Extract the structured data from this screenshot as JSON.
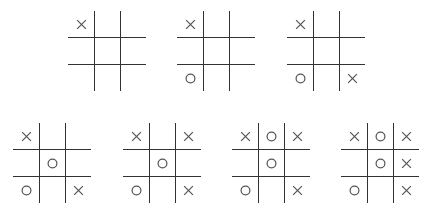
{
  "diagram": {
    "colors": {
      "line": "#333333",
      "mark": "#555555",
      "background": "#ffffff"
    },
    "boards": [
      {
        "step": 1,
        "left": 68,
        "top": 11,
        "cells": [
          "X",
          "",
          "",
          "",
          "",
          "",
          "",
          "",
          ""
        ]
      },
      {
        "step": 2,
        "left": 177,
        "top": 11,
        "cells": [
          "X",
          "",
          "",
          "",
          "",
          "",
          "O",
          "",
          ""
        ]
      },
      {
        "step": 3,
        "left": 287,
        "top": 11,
        "cells": [
          "X",
          "",
          "",
          "",
          "",
          "",
          "O",
          "",
          "X"
        ]
      },
      {
        "step": 4,
        "left": 13,
        "top": 123,
        "cells": [
          "X",
          "",
          "",
          "",
          "O",
          "",
          "O",
          "",
          "X"
        ]
      },
      {
        "step": 5,
        "left": 123,
        "top": 123,
        "cells": [
          "X",
          "",
          "X",
          "",
          "O",
          "",
          "O",
          "",
          "X"
        ]
      },
      {
        "step": 6,
        "left": 232,
        "top": 123,
        "cells": [
          "X",
          "O",
          "X",
          "",
          "O",
          "",
          "O",
          "",
          "X"
        ]
      },
      {
        "step": 7,
        "left": 341,
        "top": 123,
        "cells": [
          "X",
          "O",
          "X",
          "",
          "O",
          "X",
          "O",
          "",
          "X"
        ]
      }
    ]
  }
}
